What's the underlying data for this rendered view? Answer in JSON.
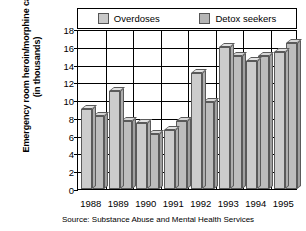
{
  "chart_data": {
    "type": "bar",
    "title": "",
    "xlabel": "",
    "ylabel": "Emergency room heroin/morphine cases (in thousands)",
    "categories": [
      "1988",
      "1989",
      "1990",
      "1991",
      "1992",
      "1993",
      "1994",
      "1995"
    ],
    "series": [
      {
        "name": "Overdoses",
        "values": [
          9.0,
          11.0,
          7.4,
          6.6,
          13.0,
          16.0,
          14.4,
          15.4
        ],
        "color": "#cccccc"
      },
      {
        "name": "Detox seekers",
        "values": [
          8.2,
          7.6,
          6.2,
          7.6,
          9.8,
          15.0,
          15.0,
          16.4
        ],
        "color": "#bdbdbd"
      }
    ],
    "ylim": [
      0,
      18
    ],
    "yticks": [
      0,
      2,
      4,
      6,
      8,
      10,
      12,
      14,
      16,
      18
    ],
    "grid": "horizontal-and-group-separators",
    "legend_position": "top",
    "source_note": "Source: Substance Abuse and Mental Health Services"
  },
  "legend": {
    "items": [
      {
        "label": "Overdoses",
        "swatch_name": "legend-swatch-overdoses"
      },
      {
        "label": "Detox seekers",
        "swatch_name": "legend-swatch-detox-seekers"
      }
    ]
  },
  "axis": {
    "y_title": "Emergency room heroin/morphine cases (in thousands)",
    "y_tick_labels": [
      "18",
      "16",
      "14",
      "12",
      "10",
      "8",
      "6",
      "4",
      "2",
      "0"
    ],
    "x_tick_labels": [
      "1988",
      "1989",
      "1990",
      "1991",
      "1992",
      "1993",
      "1994",
      "1995"
    ]
  },
  "footer": {
    "source": "Source: Substance Abuse and Mental Health Services"
  }
}
